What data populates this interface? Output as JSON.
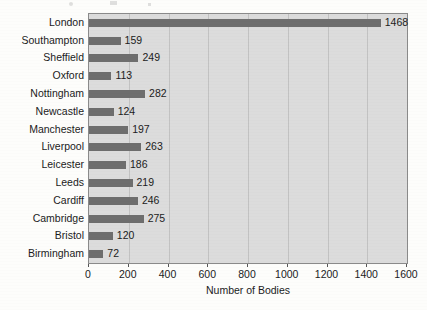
{
  "chart_data": {
    "type": "bar",
    "orientation": "horizontal",
    "title": "",
    "xlabel": "Number of Bodies",
    "ylabel": "",
    "xlim": [
      0,
      1600
    ],
    "xticks": [
      0,
      200,
      400,
      600,
      800,
      1000,
      1200,
      1400,
      1600
    ],
    "grid": "vertical",
    "legend": "none",
    "categories": [
      "London",
      "Southampton",
      "Sheffield",
      "Oxford",
      "Nottingham",
      "Newcastle",
      "Manchester",
      "Liverpool",
      "Leicester",
      "Leeds",
      "Cardiff",
      "Cambridge",
      "Bristol",
      "Birmingham"
    ],
    "values": [
      1468,
      159,
      249,
      113,
      282,
      124,
      197,
      263,
      186,
      219,
      246,
      275,
      120,
      72
    ],
    "value_labels": [
      "1468",
      "159",
      "249",
      "113",
      "282",
      "124",
      "197",
      "263",
      "186",
      "219",
      "246",
      "275",
      "120",
      "72"
    ],
    "colors": {
      "bar": "#6e6e6e",
      "plot_background": "#dcdcdc",
      "gridline": "#c2c2c2",
      "axis": "#8a8a8a",
      "text": "#1b1b1b",
      "page_background": "#fdfdfb"
    }
  }
}
